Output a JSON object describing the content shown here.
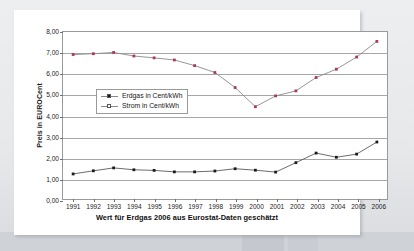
{
  "chart_data": {
    "type": "line",
    "title": "",
    "subtitle": "",
    "xlabel": "",
    "ylabel": "Preis in EUROCent",
    "caption": "Wert für Erdgas 2006 aus Eurostat-Daten geschätzt",
    "categories": [
      "1991",
      "1992",
      "1993",
      "1994",
      "1995",
      "1996",
      "1997",
      "1998",
      "1999",
      "2000",
      "2001",
      "2002",
      "2003",
      "2004",
      "2005",
      "2006"
    ],
    "x": [
      1991,
      1992,
      1993,
      1994,
      1995,
      1996,
      1997,
      1998,
      1999,
      2000,
      2001,
      2002,
      2003,
      2004,
      2005,
      2006
    ],
    "ylim": [
      0,
      8
    ],
    "ytick_values": [
      0,
      1,
      2,
      3,
      4,
      5,
      6,
      7,
      8
    ],
    "ytick_labels": [
      "0,00",
      "1,00",
      "2,00",
      "3,00",
      "4,00",
      "5,00",
      "6,00",
      "7,00",
      "8,00"
    ],
    "grid": true,
    "legend_position": "upper-left-inside",
    "series": [
      {
        "name": "Strom in Cent/kWh",
        "color": "#b0355c",
        "line_color": "#8a8a8a",
        "marker": "square",
        "values": [
          6.92,
          6.96,
          7.02,
          6.85,
          6.76,
          6.66,
          6.39,
          6.06,
          5.34,
          4.42,
          4.94,
          5.18,
          5.82,
          6.22,
          6.8,
          7.55
        ]
      },
      {
        "name": "Erdgas in Cent/kWh",
        "color": "#1a1a1a",
        "line_color": "#5a5a5a",
        "marker": "square",
        "values": [
          1.2,
          1.35,
          1.49,
          1.4,
          1.37,
          1.3,
          1.3,
          1.34,
          1.45,
          1.38,
          1.29,
          1.74,
          2.2,
          2.0,
          2.15,
          2.73
        ]
      }
    ]
  },
  "legend": {
    "items": [
      {
        "label": "Erdgas in Cent/kWh",
        "marker_color": "#1a1a1a",
        "line_color": "#8a8a8a"
      },
      {
        "label": "Strom in Cent/kWh",
        "marker_color": "#ffffff",
        "line_color": "#8a8a8a"
      }
    ]
  },
  "axis": {
    "y_title": "Preis in EUROCent"
  },
  "footer": {
    "note": "Wert für Erdgas 2006 aus Eurostat-Daten geschätzt"
  }
}
